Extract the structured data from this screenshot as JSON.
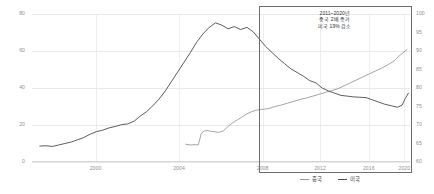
{
  "chart_data": {
    "type": "line",
    "title": "",
    "xlabel": "",
    "ylabel": "",
    "grid": true,
    "legend_position": "bottom-right",
    "x_ticks": [
      "2000",
      "2004",
      "2008",
      "2012",
      "2016",
      "2020"
    ],
    "x_tick_positions_pct": [
      16.8,
      38.9,
      61.0,
      76.2,
      89.1,
      98.5
    ],
    "xlim": [
      1996.5,
      2020.6
    ],
    "y_axis_left": {
      "ticks": [
        "80",
        "60",
        "40",
        "20",
        "0"
      ],
      "ylim": [
        0,
        90
      ]
    },
    "y_axis_right": {
      "ticks": [
        "100",
        "95",
        "90",
        "85",
        "80",
        "75",
        "70",
        "65",
        "60"
      ],
      "ylim": [
        60,
        100
      ]
    },
    "series": [
      {
        "name": "중국",
        "color": "#9a9a9a",
        "axis": "right",
        "x": [
          2006.3,
          2006.6,
          2006.9,
          2007.1,
          2007.3,
          2007.5,
          2007.7,
          2007.9,
          2008.1,
          2008.4,
          2008.7,
          2009.0,
          2009.3,
          2009.6,
          2009.9,
          2010.2,
          2010.5,
          2010.8,
          2011.1,
          2011.4,
          2011.7,
          2012.0,
          2012.4,
          2012.8,
          2013.2,
          2013.6,
          2014.0,
          2014.4,
          2014.8,
          2015.2,
          2015.6,
          2016.0,
          2016.4,
          2016.8,
          2017.2,
          2017.6,
          2018.0,
          2018.4,
          2018.8,
          2019.2,
          2019.6,
          2020.0,
          2020.4
        ],
        "values": [
          64.8,
          64.6,
          64.7,
          64.6,
          67.8,
          68.4,
          68.5,
          68.3,
          68.2,
          68.0,
          68.4,
          69.6,
          70.6,
          71.4,
          72.2,
          73.0,
          73.6,
          74.0,
          74.2,
          74.3,
          74.6,
          75.0,
          75.4,
          75.9,
          76.4,
          76.9,
          77.3,
          77.8,
          78.3,
          78.8,
          79.3,
          79.8,
          80.6,
          81.4,
          82.2,
          83.0,
          83.8,
          84.6,
          85.4,
          86.3,
          87.4,
          89.0,
          90.4
        ]
      },
      {
        "name": "미국",
        "color": "#4a4a4a",
        "axis": "right",
        "x": [
          1997.0,
          1997.4,
          1997.8,
          1998.2,
          1998.6,
          1999.0,
          1999.4,
          1999.8,
          2000.2,
          2000.6,
          2001.0,
          2001.4,
          2001.8,
          2002.2,
          2002.6,
          2003.0,
          2003.4,
          2003.8,
          2004.2,
          2004.6,
          2005.0,
          2005.4,
          2005.8,
          2006.2,
          2006.6,
          2007.0,
          2007.4,
          2007.8,
          2008.2,
          2008.6,
          2009.0,
          2009.4,
          2009.8,
          2010.2,
          2010.6,
          2011.0,
          2011.4,
          2011.8,
          2012.2,
          2012.6,
          2013.0,
          2013.4,
          2013.8,
          2014.2,
          2014.6,
          2015.0,
          2015.4,
          2015.8,
          2016.2,
          2016.6,
          2017.0,
          2017.4,
          2017.8,
          2018.2,
          2018.6,
          2019.0,
          2019.4,
          2019.8,
          2020.1,
          2020.3,
          2020.5
        ],
        "values": [
          64.3,
          64.4,
          64.2,
          64.6,
          65.0,
          65.4,
          66.0,
          66.6,
          67.5,
          68.2,
          68.6,
          69.2,
          69.6,
          70.1,
          70.3,
          71.0,
          72.4,
          73.6,
          75.2,
          77.0,
          79.2,
          81.8,
          84.4,
          87.0,
          89.6,
          92.4,
          94.6,
          96.4,
          97.6,
          97.0,
          96.0,
          96.6,
          95.8,
          96.4,
          95.2,
          93.2,
          91.2,
          89.6,
          88.0,
          86.6,
          85.2,
          84.2,
          83.2,
          82.0,
          81.4,
          80.0,
          79.2,
          78.6,
          78.0,
          77.8,
          77.6,
          77.5,
          77.4,
          76.8,
          76.2,
          75.6,
          75.2,
          74.8,
          75.4,
          77.2,
          78.6
        ]
      }
    ],
    "annotation": {
      "line1": "2011~2020년",
      "line2": "중국 2배 증가",
      "line3": "미국 19% 감소"
    },
    "highlight_region": {
      "x_start": 2011.0,
      "x_end": 2020.6,
      "border_color": "#6d6d6d"
    }
  }
}
